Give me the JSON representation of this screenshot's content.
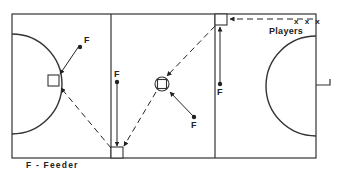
{
  "diagram": {
    "type": "hockey drill diagram",
    "legend": "F - Feeder",
    "players_label": "Players",
    "players_marks": "x x x",
    "feeder_label": "F",
    "feeders": [
      {
        "id": "feeder-left",
        "label": "F"
      },
      {
        "id": "feeder-center-left",
        "label": "F"
      },
      {
        "id": "feeder-center-right",
        "label": "F"
      },
      {
        "id": "feeder-right",
        "label": "F"
      }
    ],
    "colors": {
      "line": "#222222",
      "background": "#ffffff"
    }
  }
}
